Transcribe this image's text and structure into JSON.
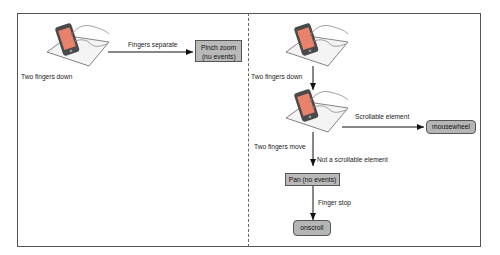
{
  "left_panel": {
    "start_label": "Two fingers down",
    "transition_label": "Fingers separate",
    "result_box": {
      "line1": "Pinch zoom",
      "line2": "(nu events)"
    }
  },
  "right_panel": {
    "step1_label": "Two fingers down",
    "step2_label": "Two fingers move",
    "branch_scrollable_label": "Scrollable element",
    "branch_scrollable_result": "mousewheel",
    "branch_not_scrollable_label": "Not a scrollable element",
    "pan_box": "Pan (no events)",
    "finger_stop_label": "Finger stop",
    "final_result": "onscroll"
  },
  "colors": {
    "box_fill": "#b9b9b9",
    "phone_body": "#4a4a4a",
    "phone_screen": "#e8826a",
    "tablet_fill": "#f4f4f4",
    "border": "#555555"
  }
}
